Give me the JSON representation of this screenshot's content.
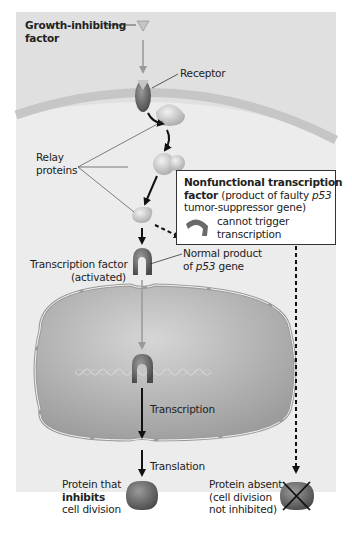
{
  "diagram": {
    "labels": {
      "growth_factor_1": "Growth-inhibiting",
      "growth_factor_2": "factor",
      "receptor": "Receptor",
      "relay_1": "Relay",
      "relay_2": "proteins",
      "tf_1": "Transcription factor",
      "tf_2": "(activated)",
      "normal_1": "Normal product",
      "normal_2_pre": "of ",
      "normal_2_gene": "p53",
      "normal_2_post": " gene",
      "transcription": "Transcription",
      "translation": "Translation",
      "protein_1": "Protein that",
      "protein_2": "inhibits",
      "protein_3": "cell division",
      "absent_1": "Protein absent",
      "absent_2": "(cell division",
      "absent_3": "not inhibited)"
    },
    "nonfunctional_box": {
      "line1": "Nonfunctional transcription",
      "line2_bold": "factor",
      "line2_rest": " (product of faulty ",
      "line2_gene": "p53",
      "line3": "tumor-suppressor gene)",
      "line4": "cannot trigger",
      "line5": "transcription"
    },
    "colors": {
      "background": "#ececec",
      "cytoplasm": "#e9e9e9",
      "membrane": "#c9c9c9",
      "nucleus": "#b5b5b5",
      "protein_dark": "#6e6e6e",
      "protein_light": "#cfcfcf",
      "arrow": "#111111",
      "signal_arrow": "#9a9a9a"
    }
  }
}
